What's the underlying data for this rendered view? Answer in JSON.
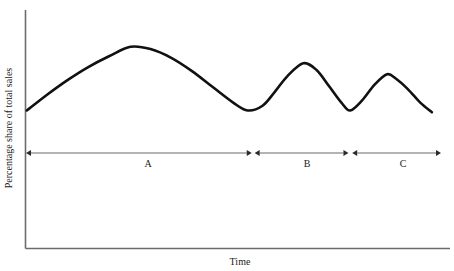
{
  "chart_data": {
    "type": "line",
    "title": "",
    "subtitle": "",
    "xlabel": "Time",
    "ylabel": "Percentage share of total sales",
    "grid": false,
    "legend": "none",
    "axis_color": "#6b6b6b",
    "curve_color": "#111111",
    "annotation_color": "#2a2a2a",
    "xlim": [
      0,
      100
    ],
    "ylim": [
      0,
      100
    ],
    "x_tick_labels": [],
    "y_tick_labels": [],
    "series": [
      {
        "name": "Percentage share of total sales",
        "x": [
          0.2,
          5,
          10,
          15,
          20,
          25.2,
          30,
          35,
          40,
          45,
          50,
          53.4,
          57,
          60,
          63,
          66.8,
          70,
          73,
          76,
          78.1,
          81,
          84,
          87,
          89.1,
          92,
          95,
          97.8
        ],
        "values": [
          56.9,
          63.8,
          70.4,
          76.2,
          81.0,
          85.2,
          84.2,
          80.3,
          74.4,
          67.3,
          60.3,
          56.9,
          59.0,
          65.3,
          72.2,
          77.9,
          74.9,
          67.8,
          60.4,
          56.9,
          61.4,
          68.4,
          73.0,
          71.1,
          66.4,
          60.4,
          56.1
        ]
      }
    ],
    "annotations": {
      "axis_label_x": "Time",
      "axis_label_y": "Percentage share of total sales",
      "phase_segments": [
        {
          "label": "A",
          "label_x": 29.0,
          "start_x": 0.0,
          "end_x": 54.4
        },
        {
          "label": "B",
          "label_x": 66.4,
          "start_x": 55.1,
          "end_x": 77.7
        },
        {
          "label": "C",
          "label_x": 88.7,
          "start_x": 78.6,
          "end_x": 100.0
        }
      ]
    }
  }
}
